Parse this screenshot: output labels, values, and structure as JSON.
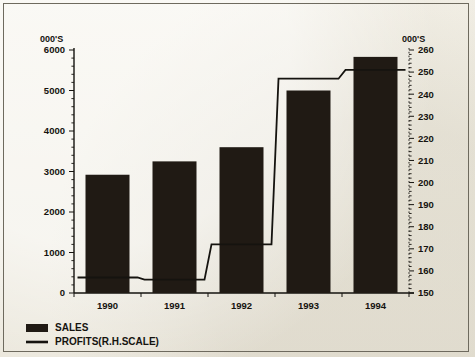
{
  "chart_data": {
    "type": "bar",
    "title": "",
    "subtitle": "",
    "xlabel": "",
    "ylabel": "000'S",
    "y2label": "000'S",
    "categories": [
      "1990",
      "1991",
      "1992",
      "1993",
      "1994"
    ],
    "series": [
      {
        "name": "SALES",
        "type": "bar",
        "axis": "left",
        "values": [
          2920,
          3250,
          3600,
          5000,
          5830
        ]
      },
      {
        "name": "PROFITS(R.H.SCALE)",
        "type": "line",
        "axis": "right",
        "values": [
          157,
          156,
          172,
          247,
          251
        ]
      }
    ],
    "ylim": [
      0,
      6000
    ],
    "y2lim": [
      150,
      260
    ],
    "yticks": [
      0,
      1000,
      2000,
      3000,
      4000,
      5000,
      6000
    ],
    "yticklabels": [
      "0",
      "1000",
      "2000",
      "3000",
      "4000",
      "5000",
      "6000"
    ],
    "y2ticks": [
      150,
      160,
      170,
      180,
      190,
      200,
      210,
      220,
      230,
      240,
      250,
      260
    ],
    "y2ticklabels": [
      "150",
      "160",
      "170",
      "180",
      "190",
      "200",
      "210",
      "220",
      "230",
      "240",
      "250",
      "260"
    ],
    "grid": false,
    "legend_position": "below-left",
    "legend": [
      {
        "label": "SALES",
        "marker": "filled-rect"
      },
      {
        "label": "PROFITS(R.H.SCALE)",
        "marker": "line"
      }
    ],
    "colors": {
      "bar": "#201a14",
      "line": "#15130f",
      "axis": "#15130f",
      "background": "#f1eee4",
      "frame": "#6e6a5e"
    }
  },
  "axes": {
    "left_unit": "000'S",
    "right_unit": "000'S"
  }
}
